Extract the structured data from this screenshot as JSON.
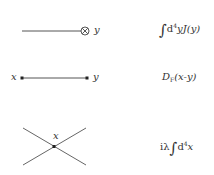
{
  "rows": [
    {
      "name": "source-term",
      "diagram": {
        "type": "external-source",
        "line": {
          "x1": 22,
          "y1": 31,
          "x2": 81,
          "y2": 31
        },
        "source_symbol": "⊗",
        "source_center": [
          85,
          31
        ],
        "labels": [
          {
            "text": "y",
            "x": 94,
            "y": 25
          }
        ]
      },
      "rule": {
        "integral": "∫",
        "d": "d",
        "power": "4",
        "var": "y",
        "func": "J",
        "arg": "(y)"
      }
    },
    {
      "name": "propagator",
      "diagram": {
        "type": "propagator",
        "line": {
          "x1": 22,
          "y1": 78,
          "x2": 87,
          "y2": 78
        },
        "vertices": [
          [
            22,
            78
          ],
          [
            87,
            78
          ]
        ],
        "labels": [
          {
            "text": "x",
            "x": 11,
            "y": 73
          },
          {
            "text": "y",
            "x": 93,
            "y": 73
          }
        ]
      },
      "rule": {
        "func": "D",
        "subscript": "F",
        "arg": "(x-y)"
      }
    },
    {
      "name": "vertex",
      "diagram": {
        "type": "four-point-vertex",
        "lines": [
          {
            "x1": 23,
            "y1": 128,
            "x2": 86,
            "y2": 165
          },
          {
            "x1": 23,
            "y1": 165,
            "x2": 86,
            "y2": 128
          }
        ],
        "vertex": [
          54,
          147
        ],
        "labels": [
          {
            "text": "x",
            "x": 53,
            "y": 132
          }
        ]
      },
      "rule": {
        "prefix": "iλ",
        "integral": "∫",
        "d": "d",
        "power": "4",
        "var": "x"
      }
    }
  ],
  "colors": {
    "line": "#555555",
    "text": "#333333",
    "background": "#ffffff"
  }
}
